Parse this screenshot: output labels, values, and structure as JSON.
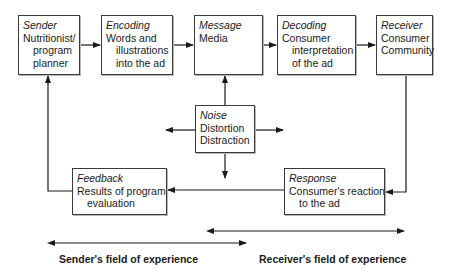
{
  "diagram": {
    "nodes": {
      "sender": {
        "title": "Sender",
        "lines": [
          "Nutritionist/",
          "program",
          "planner"
        ]
      },
      "encoding": {
        "title": "Encoding",
        "lines": [
          "Words and",
          "illustrations",
          "into the ad"
        ]
      },
      "message": {
        "title": "Message",
        "lines": [
          "Media"
        ]
      },
      "decoding": {
        "title": "Decoding",
        "lines": [
          "Consumer",
          "interpretation",
          "of the ad"
        ]
      },
      "receiver": {
        "title": "Receiver",
        "lines": [
          "Consumer",
          "Community"
        ]
      },
      "noise": {
        "title": "Noise",
        "lines": [
          "Distortion",
          "Distraction"
        ]
      },
      "feedback": {
        "title": "Feedback",
        "lines": [
          "Results of program",
          "evaluation"
        ]
      },
      "response": {
        "title": "Response",
        "lines": [
          "Consumer's reaction",
          "to the ad"
        ]
      }
    },
    "fields": {
      "sender_field": "Sender's field of experience",
      "receiver_field": "Receiver's field of experience"
    }
  }
}
